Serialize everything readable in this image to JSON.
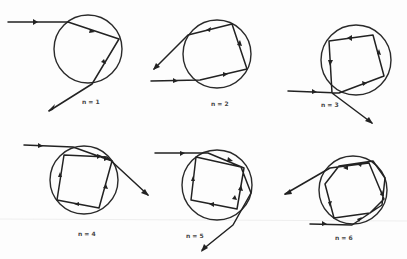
{
  "figure": {
    "panels": [
      {
        "id": "n1",
        "label": "n = 1",
        "reflections": 1
      },
      {
        "id": "n2",
        "label": "n = 2",
        "reflections": 2
      },
      {
        "id": "n3",
        "label": "n = 3",
        "reflections": 3
      },
      {
        "id": "n4",
        "label": "n = 4",
        "reflections": 4
      },
      {
        "id": "n5",
        "label": "n = 5",
        "reflections": 5
      },
      {
        "id": "n6",
        "label": "n = 6",
        "reflections": 6
      }
    ],
    "colors": {
      "ink": "#222222",
      "paper": "#fdfdfd"
    }
  }
}
